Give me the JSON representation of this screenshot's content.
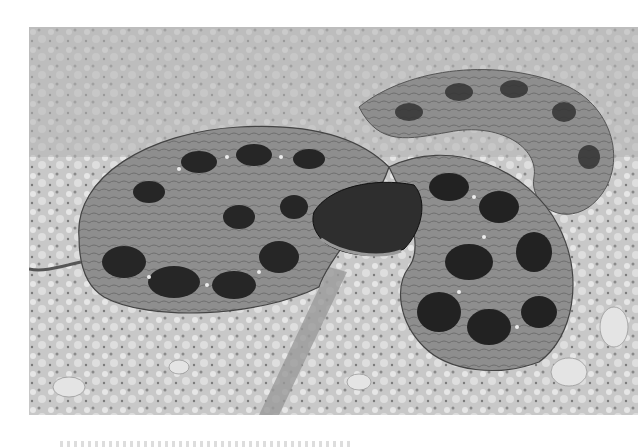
{
  "figure": {
    "alt": "Black-and-white photograph of a coiled snake with dark blotched pattern resting on sandy, pebbly soil",
    "colors": {
      "background": "#ffffff",
      "ground_light": "#d9d9d9",
      "ground_mid": "#a9a9a9",
      "snake_body": "#8c8c8c",
      "blotch": "#262626",
      "edge_light": "#efefef"
    }
  }
}
